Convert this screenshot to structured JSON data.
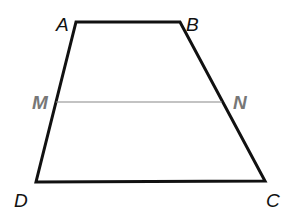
{
  "diagram": {
    "type": "trapezoid",
    "vertices": {
      "A": {
        "label": "A",
        "x": 76,
        "y": 22
      },
      "B": {
        "label": "B",
        "x": 180,
        "y": 22
      },
      "C": {
        "label": "C",
        "x": 265,
        "y": 181
      },
      "D": {
        "label": "D",
        "x": 36,
        "y": 182
      }
    },
    "midsegment": {
      "M": {
        "label": "M",
        "x": 56,
        "y": 102
      },
      "N": {
        "label": "N",
        "x": 222,
        "y": 102
      }
    },
    "colors": {
      "outline": "#111111",
      "midsegment": "#888888",
      "midpoint_labels": "#777777"
    }
  }
}
